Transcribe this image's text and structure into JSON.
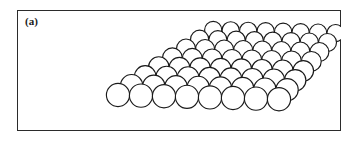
{
  "figure": {
    "panel_label": "(a)",
    "caption_text": "(a)",
    "frame": {
      "x": 17,
      "y": 10,
      "width": 324,
      "height": 121,
      "border_color": "#2b2b2b",
      "border_width": 1.4,
      "background_color": "#ffffff"
    },
    "lattice": {
      "type": "close-packed-sphere-monolayer",
      "rows": 8,
      "columns": 8,
      "sphere_count": 64,
      "sphere_fill": "#ffffff",
      "sphere_stroke": "#1a1a1a",
      "sphere_stroke_width": 1.15,
      "projection": "oblique-perspective",
      "origin": {
        "x": 118,
        "y": 95
      },
      "row_step": {
        "dx": 23.0,
        "dy": 0.6
      },
      "col_step": {
        "dx": 13.6,
        "dy": -9.3
      },
      "row_scale_far": 0.76,
      "radius_near": 11.6,
      "radius_far": 8.6,
      "corners": {
        "left": {
          "x": 30,
          "y": 83
        },
        "top": {
          "x": 140,
          "y": 28
        },
        "right": {
          "x": 325,
          "y": 72
        },
        "bottom": {
          "x": 215,
          "y": 118
        }
      }
    }
  }
}
